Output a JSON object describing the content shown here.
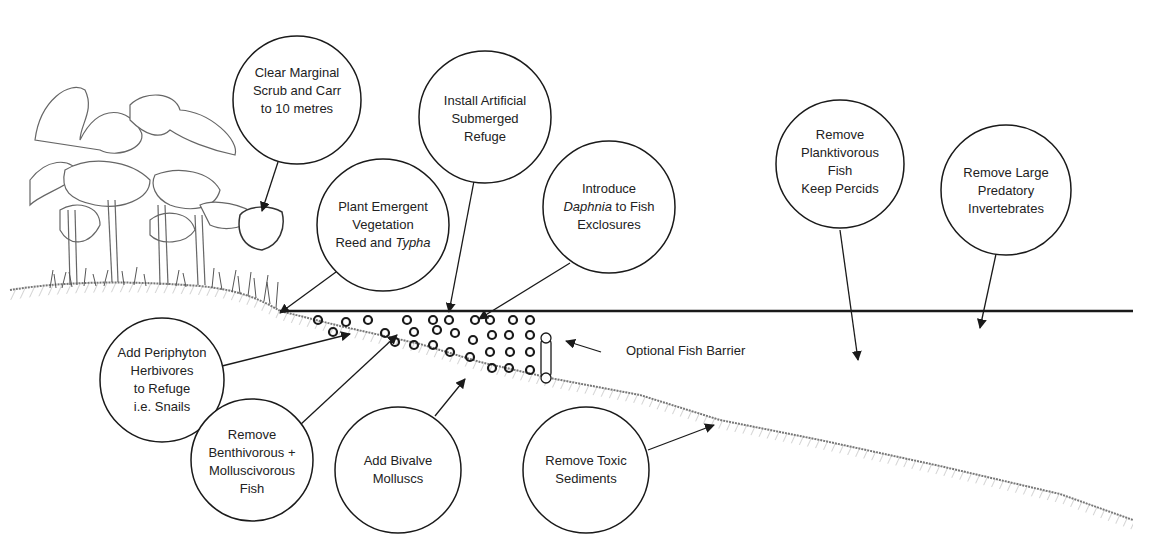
{
  "diagram": {
    "type": "lake-restoration-cross-section",
    "water_line": {
      "x1": 280,
      "x2": 1133,
      "y": 311
    },
    "callouts": [
      {
        "id": "clear-scrub",
        "lines": [
          "Clear Marginal",
          "Scrub and Carr",
          "to 10 metres"
        ],
        "cx": 297,
        "cy": 100,
        "r": 64,
        "arrow_to": [
          262,
          211
        ]
      },
      {
        "id": "plant-emergent",
        "lines": [
          "Plant Emergent",
          "Vegetation",
          "Reed and |Typha|"
        ],
        "cx": 383,
        "cy": 225,
        "r": 66,
        "arrow_to": [
          278,
          314
        ]
      },
      {
        "id": "install-refuge",
        "lines": [
          "Install Artificial",
          "Submerged",
          "Refuge"
        ],
        "cx": 485,
        "cy": 117,
        "r": 66,
        "arrow_to": [
          448,
          313
        ]
      },
      {
        "id": "introduce-daphnia",
        "lines": [
          "Introduce",
          "|Daphnia| to Fish",
          "Exclosures"
        ],
        "cx": 609,
        "cy": 207,
        "r": 66,
        "arrow_to": [
          477,
          320
        ]
      },
      {
        "id": "remove-planktivorous",
        "lines": [
          "Remove",
          "Planktivorous",
          "Fish",
          "Keep Percids"
        ],
        "cx": 840,
        "cy": 164,
        "r": 66,
        "arrow_to": [
          859,
          362
        ]
      },
      {
        "id": "remove-invertebrates",
        "lines": [
          "Remove Large",
          "Predatory",
          "Invertebrates"
        ],
        "cx": 1006,
        "cy": 190,
        "r": 65,
        "arrow_to": [
          980,
          330
        ]
      },
      {
        "id": "add-periphyton",
        "lines": [
          "Add Periphyton",
          "Herbivores",
          "to Refuge",
          "i.e. Snails"
        ],
        "cx": 162,
        "cy": 380,
        "r": 62,
        "arrow_to": [
          352,
          334
        ]
      },
      {
        "id": "remove-benthivorous",
        "lines": [
          "Remove",
          "Benthivorous +",
          "Molluscivorous",
          "Fish"
        ],
        "cx": 252,
        "cy": 460,
        "r": 61,
        "arrow_to": [
          398,
          334
        ]
      },
      {
        "id": "add-bivalve",
        "lines": [
          "Add Bivalve",
          "Molluscs"
        ],
        "cx": 398,
        "cy": 470,
        "r": 63,
        "arrow_to": [
          466,
          378
        ]
      },
      {
        "id": "remove-toxic",
        "lines": [
          "Remove Toxic",
          "Sediments"
        ],
        "cx": 586,
        "cy": 470,
        "r": 63,
        "arrow_to": [
          716,
          424
        ]
      }
    ],
    "barrier_label": {
      "text": "Optional Fish Barrier",
      "x": 618,
      "y": 345,
      "arrow_from": [
        601,
        352
      ],
      "arrow_to": [
        564,
        341
      ]
    },
    "colors": {
      "ink": "#1a1a1a",
      "sediment": "#888888",
      "background": "#ffffff"
    }
  }
}
